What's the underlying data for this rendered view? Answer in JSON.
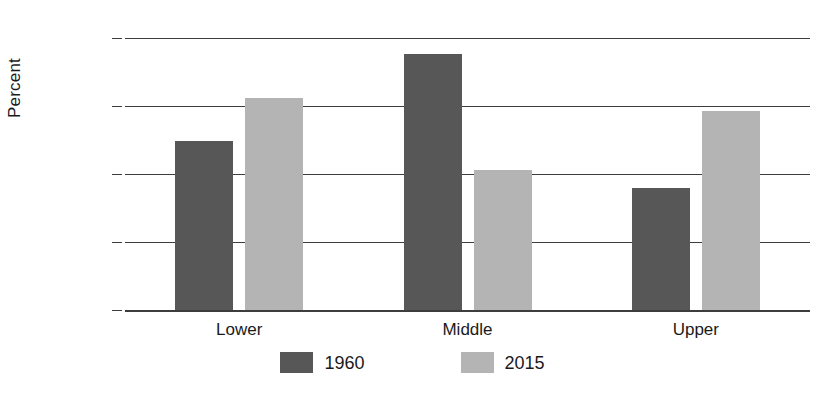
{
  "chart_data": {
    "type": "bar",
    "title": "",
    "subtitle": "",
    "xlabel": "",
    "ylabel": "Percent",
    "categories": [
      "Lower",
      "Middle",
      "Upper"
    ],
    "series": [
      {
        "name": "1960",
        "color": "#575757",
        "values": [
          31.0,
          47.0,
          22.4
        ]
      },
      {
        "name": "2015",
        "color": "#b4b4b4",
        "values": [
          39.0,
          25.8,
          36.6
        ]
      }
    ],
    "ylim": [
      0.0,
      50.0
    ],
    "ytick_labels": [
      "0.0",
      "12.5",
      "25.0",
      "37.5",
      "50.0"
    ],
    "ytick_values": [
      0.0,
      12.5,
      25.0,
      37.5,
      50.0
    ],
    "grid": true,
    "grid_axis": "y",
    "legend_position": "bottom",
    "grouped": true
  },
  "axes": {
    "y_title": "Percent"
  },
  "legend": {
    "items": [
      {
        "label": "1960",
        "color": "#575757"
      },
      {
        "label": "2015",
        "color": "#b4b4b4"
      }
    ]
  },
  "colors": {
    "series_1960": "#575757",
    "series_2015": "#b4b4b4",
    "gridline": "#3d3d3d",
    "text": "#1a1a1a",
    "background": "#ffffff"
  }
}
